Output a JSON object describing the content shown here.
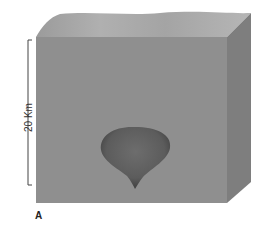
{
  "figure": {
    "panel_label": "A",
    "scale_bar": {
      "label": "20 Km"
    },
    "block": {
      "front_color": "#8e8e8e",
      "top_color": "#a6a6a6",
      "side_color": "#7f7f7f"
    },
    "blob": {
      "color": "#555555",
      "name": "magma-body"
    }
  }
}
